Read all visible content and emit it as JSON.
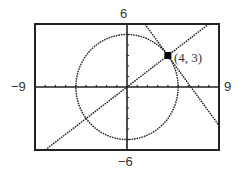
{
  "chart_data": {
    "type": "line",
    "title": "",
    "xlabel": "",
    "ylabel": "",
    "xlim": [
      -9,
      9
    ],
    "ylim": [
      -6,
      6
    ],
    "grid": false,
    "x_tick_step": 1,
    "y_tick_step": 1,
    "window_labels": {
      "xmin": "−9",
      "xmax": "9",
      "ymin": "−6",
      "ymax": "6"
    },
    "series": [
      {
        "name": "circle",
        "kind": "circle",
        "equation": "x^2 + y^2 = 25",
        "center": [
          0,
          0
        ],
        "radius": 5,
        "style": "dotted"
      },
      {
        "name": "line-through-origin",
        "kind": "line",
        "equation": "y = (3/4)x",
        "slope": 0.75,
        "intercept": 0,
        "style": "dotted"
      },
      {
        "name": "tangent-line",
        "kind": "line",
        "equation": "y = -(4/3)x + 25/3",
        "slope": -1.3333,
        "intercept": 8.3333,
        "style": "dotted"
      }
    ],
    "annotations": [
      {
        "text": "(4, 3)",
        "x": 4,
        "y": 3,
        "marker": "filled-square"
      }
    ]
  },
  "labels": {
    "xmin": "−9",
    "xmax": "9",
    "ymin": "−6",
    "ymax": "6",
    "point": "(4, 3)"
  },
  "colors": {
    "ink": "#222222",
    "label": "#333333",
    "background": "#ffffff"
  }
}
